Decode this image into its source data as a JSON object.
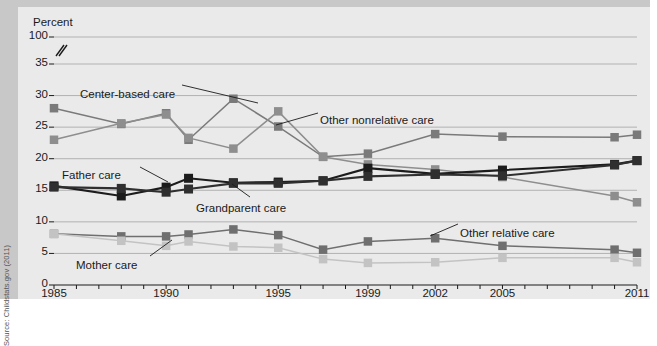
{
  "figure": {
    "axis_title": "Percent",
    "source": "Source: Childstats.gov (2011)"
  },
  "chart_data": {
    "type": "line",
    "title": "",
    "xlabel": "",
    "ylabel": "Percent",
    "ylim": [
      0,
      35
    ],
    "y_axis_break": {
      "present": true,
      "below": 35,
      "top_label": 100
    },
    "grid": true,
    "legend_position": "inline-annotations",
    "y_ticks": [
      0,
      5,
      10,
      15,
      20,
      25,
      30,
      35,
      100
    ],
    "x_tick_labels": [
      "1985",
      "1990",
      "1995",
      "1999",
      "2002",
      "2005",
      "2011"
    ],
    "x": [
      1985,
      1988,
      1990,
      1991,
      1993,
      1995,
      1997,
      1999,
      2002,
      2005,
      2010,
      2011
    ],
    "series": [
      {
        "name": "Center-based care",
        "color": "#7a7a7a",
        "values": [
          28,
          25.5,
          27.2,
          23,
          29.5,
          25.1,
          20.3,
          20.8,
          23.9,
          23.5,
          23.4,
          23.8
        ]
      },
      {
        "name": "Other nonrelative care",
        "color": "#8e8e8e",
        "values": [
          23,
          25.6,
          27,
          23.3,
          21.6,
          27.5,
          20.3,
          19.1,
          18.3,
          17.1,
          14.1,
          13.1
        ]
      },
      {
        "name": "Father care",
        "color": "#1c1c1c",
        "values": [
          15.7,
          14.1,
          15.5,
          16.9,
          16.2,
          16.3,
          16.5,
          18.5,
          17.6,
          18.2,
          19.1,
          19.7
        ]
      },
      {
        "name": "Grandparent care",
        "color": "#2f2f2f",
        "values": [
          15.5,
          15.3,
          14.7,
          15.2,
          16.1,
          16.1,
          16.5,
          17.2,
          17.5,
          17.3,
          19,
          19.7
        ]
      },
      {
        "name": "Other relative care",
        "color": "#6f6f6f",
        "values": [
          8.1,
          7.7,
          7.7,
          8.0,
          8.8,
          7.9,
          5.6,
          6.9,
          7.4,
          6.2,
          5.6,
          5.1
        ]
      },
      {
        "name": "Mother care",
        "color": "#c3c3c3",
        "values": [
          8.1,
          7.0,
          6.2,
          6.9,
          6.1,
          5.9,
          4.1,
          3.5,
          3.6,
          4.3,
          4.3,
          3.6
        ]
      }
    ],
    "annotations": [
      {
        "text": "Center-based care",
        "x": 80,
        "y": 88
      },
      {
        "text": "Other nonrelative care",
        "x": 320,
        "y": 114
      },
      {
        "text": "Father care",
        "x": 62,
        "y": 169
      },
      {
        "text": "Grandparent care",
        "x": 196,
        "y": 202
      },
      {
        "text": "Other relative care",
        "x": 460,
        "y": 227
      },
      {
        "text": "Mother care",
        "x": 76,
        "y": 259
      }
    ]
  }
}
